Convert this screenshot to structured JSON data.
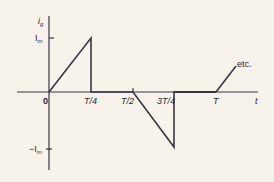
{
  "diagram": {
    "type": "waveform",
    "colors": {
      "background": "#f7f3ea",
      "line": "#3a3545",
      "text": "#2a2530"
    },
    "axes": {
      "y_label_main": "i",
      "y_label_sub": "g",
      "x_label": "t",
      "origin_label": "0",
      "ticks_x": [
        "T/4",
        "T/2",
        "3T/4",
        "T"
      ],
      "tick_y_top_main": "I",
      "tick_y_top_sub": "m",
      "tick_y_bottom_prefix": "−I",
      "tick_y_bottom_sub": "m"
    },
    "annotation": "etc.",
    "waveform_points": [
      {
        "t": "0",
        "i": 0
      },
      {
        "t": "T/4",
        "i": "Im"
      },
      {
        "t": "T/4",
        "i": 0
      },
      {
        "t": "T/2",
        "i": 0
      },
      {
        "t": "3T/4",
        "i": "-Im"
      },
      {
        "t": "3T/4",
        "i": 0
      },
      {
        "t": "T",
        "i": 0
      },
      {
        "t": "T+",
        "i": "rising (etc.)"
      }
    ]
  }
}
